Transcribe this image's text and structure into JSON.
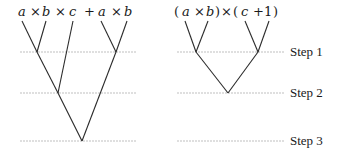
{
  "left_expression": {
    "tokens": [
      "a",
      "×",
      "b",
      "×",
      "c",
      "+",
      "a",
      "×",
      "b"
    ]
  },
  "right_expression": {
    "tokens": [
      "(",
      "a",
      "×",
      "b",
      ")",
      "×",
      "(",
      "c",
      "+",
      "1",
      ")"
    ]
  },
  "steps": [
    {
      "label": "Step 1"
    },
    {
      "label": "Step 2"
    },
    {
      "label": "Step 3"
    }
  ],
  "colors": {
    "edge": "#2a2a2a",
    "step_line": "#b8b8b8",
    "text": "#1a1a1a"
  }
}
